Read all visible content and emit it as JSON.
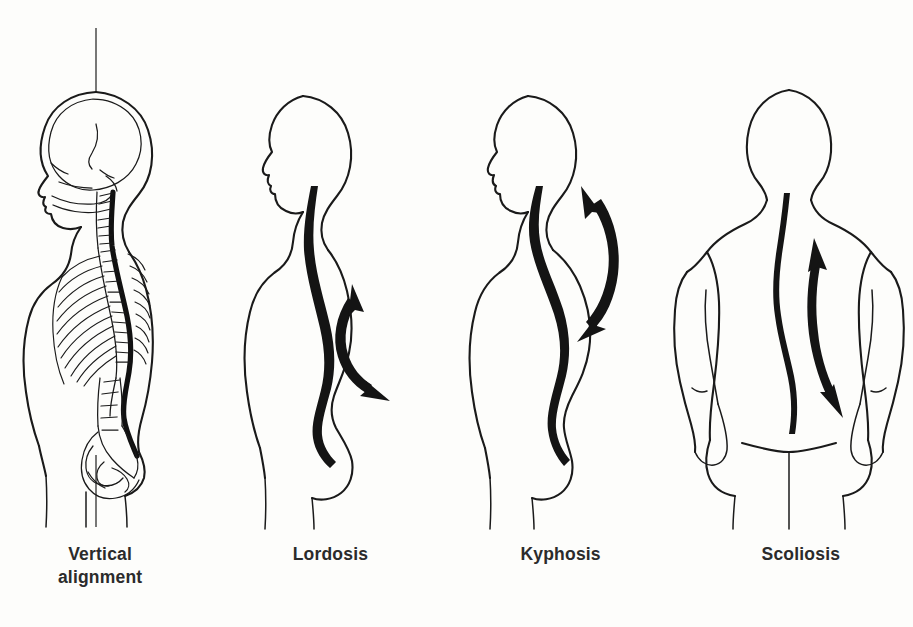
{
  "page": {
    "kind": "medical-illustration",
    "background_color": "#fdfdfb",
    "ink_color": "#1a1a1a",
    "width": 913,
    "height": 627
  },
  "figures": [
    {
      "id": "vertical-alignment",
      "caption_lines": [
        "Vertical",
        "alignment"
      ],
      "view": "lateral",
      "has_skeleton": true,
      "has_plumb_line": true,
      "has_arrow": false,
      "parts": [
        "skull",
        "cervical-vertebrae",
        "thoracic-vertebrae",
        "ribs",
        "lumbar-vertebrae",
        "sacrum",
        "pelvis",
        "spinal-cord"
      ]
    },
    {
      "id": "lordosis",
      "caption_lines": [
        "Lordosis"
      ],
      "view": "lateral",
      "has_skeleton": false,
      "has_plumb_line": false,
      "has_arrow": true,
      "arrow_type": "double-headed-curved",
      "arrow_region": "lumbar",
      "parts": [
        "head-profile",
        "neck",
        "torso-outline",
        "spine-curve",
        "buttock",
        "legs"
      ]
    },
    {
      "id": "kyphosis",
      "caption_lines": [
        "Kyphosis"
      ],
      "view": "lateral",
      "has_skeleton": false,
      "has_plumb_line": false,
      "has_arrow": true,
      "arrow_type": "double-headed-curved",
      "arrow_region": "thoracic",
      "parts": [
        "head-profile",
        "neck",
        "torso-outline",
        "spine-curve",
        "buttock",
        "legs"
      ]
    },
    {
      "id": "scoliosis",
      "caption_lines": [
        "Scoliosis"
      ],
      "view": "posterior",
      "has_skeleton": false,
      "has_plumb_line": false,
      "has_arrow": true,
      "arrow_type": "double-headed-curved",
      "arrow_region": "lateral-deviation",
      "parts": [
        "head-back",
        "neck",
        "shoulders",
        "arms",
        "back-outline",
        "spine-curve",
        "gluteal-cleft",
        "legs"
      ]
    }
  ]
}
